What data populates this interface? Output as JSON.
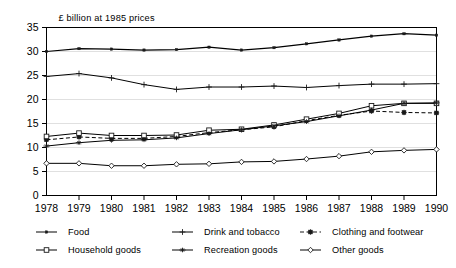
{
  "chart_data": {
    "type": "line",
    "title": "£ billion at 1985 prices",
    "xlabel": "",
    "ylabel": "",
    "x": [
      1978,
      1979,
      1980,
      1981,
      1982,
      1983,
      1984,
      1985,
      1986,
      1987,
      1988,
      1989,
      1990
    ],
    "categories": [
      "1978",
      "1979",
      "1980",
      "1981",
      "1982",
      "1983",
      "1984",
      "1985",
      "1986",
      "1987",
      "1988",
      "1989",
      "1990"
    ],
    "xlim": [
      1978,
      1990
    ],
    "ylim": [
      0,
      35
    ],
    "yticks": [
      0,
      5,
      10,
      15,
      20,
      25,
      30,
      35
    ],
    "ytick_labels": [
      "0",
      "5",
      "10",
      "15",
      "20",
      "25",
      "30",
      "35"
    ],
    "grid": true,
    "legend_position": "bottom",
    "series": [
      {
        "name": "Food",
        "marker": "dot",
        "dash": "solid",
        "color": "#000000",
        "values": [
          30.0,
          30.6,
          30.5,
          30.3,
          30.4,
          30.9,
          30.3,
          30.8,
          31.6,
          32.4,
          33.2,
          33.7,
          33.4
        ]
      },
      {
        "name": "Drink and tobacco",
        "marker": "plus",
        "dash": "solid",
        "color": "#000000",
        "values": [
          24.8,
          25.4,
          24.5,
          23.1,
          22.1,
          22.6,
          22.6,
          22.8,
          22.5,
          22.9,
          23.2,
          23.2,
          23.3
        ]
      },
      {
        "name": "Clothing and footwear",
        "marker": "asterisk",
        "dash": "dashed",
        "color": "#000000",
        "values": [
          11.6,
          12.2,
          11.9,
          11.9,
          12.3,
          13.1,
          13.7,
          14.3,
          15.6,
          16.7,
          17.6,
          17.3,
          17.2
        ]
      },
      {
        "name": "Household goods",
        "marker": "square",
        "dash": "solid",
        "color": "#000000",
        "values": [
          12.3,
          13.0,
          12.5,
          12.5,
          12.6,
          13.6,
          13.8,
          14.7,
          15.9,
          17.1,
          18.7,
          19.2,
          19.2
        ]
      },
      {
        "name": "Recreation goods",
        "marker": "star",
        "dash": "solid",
        "color": "#000000",
        "values": [
          10.3,
          11.0,
          11.5,
          11.6,
          12.0,
          12.9,
          13.7,
          14.5,
          15.4,
          16.6,
          17.8,
          19.2,
          19.3
        ]
      },
      {
        "name": "Other goods",
        "marker": "diamond",
        "dash": "solid",
        "color": "#000000",
        "values": [
          6.7,
          6.7,
          6.2,
          6.2,
          6.5,
          6.6,
          7.0,
          7.1,
          7.6,
          8.2,
          9.1,
          9.4,
          9.6
        ]
      }
    ]
  },
  "legend": {
    "items": [
      {
        "label": "Food",
        "marker": "dot",
        "dash": "solid"
      },
      {
        "label": "Drink and tobacco",
        "marker": "plus",
        "dash": "solid"
      },
      {
        "label": "Clothing and footwear",
        "marker": "asterisk",
        "dash": "dashed"
      },
      {
        "label": "Household goods",
        "marker": "square",
        "dash": "solid"
      },
      {
        "label": "Recreation goods",
        "marker": "star",
        "dash": "solid"
      },
      {
        "label": "Other goods",
        "marker": "diamond",
        "dash": "solid"
      }
    ]
  },
  "colors": {
    "line": "#1a1a1a",
    "grid": "#d8d8d8",
    "axis": "#000000",
    "background": "#ffffff"
  }
}
